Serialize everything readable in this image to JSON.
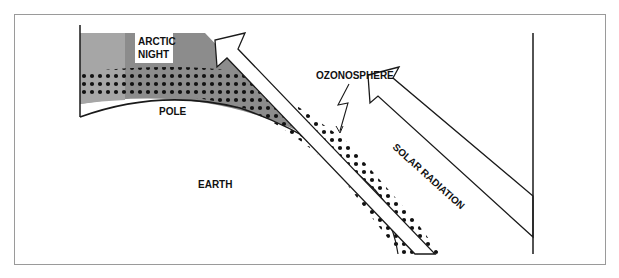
{
  "diagram": {
    "type": "polar ozone depletion schematic",
    "labels": {
      "arctic_night_line1": "ARCTIC",
      "arctic_night_line2": "NIGHT",
      "pole": "POLE",
      "earth": "EARTH",
      "ozonosphere": "OZONOSPHERE",
      "solar_radiation": "SOLAR RADIATION"
    },
    "colors": {
      "arctic_night_shade": "#8c8c8c",
      "frame_border": "#9a9a9a",
      "line": "#1a1a1a",
      "ozone_dots": "#111111",
      "background": "#ffffff"
    },
    "elements": [
      "earth-surface-curve",
      "arctic-night-shaded-region",
      "ozone-layer-dotted-band",
      "solar-radiation-arrow-short",
      "solar-radiation-arrow-long",
      "ozonosphere-pointer",
      "left-boundary-line",
      "right-boundary-line"
    ]
  }
}
